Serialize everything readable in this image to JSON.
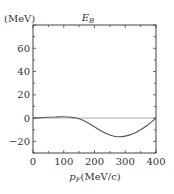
{
  "chart_data": {
    "type": "line",
    "title_main": "E",
    "title_sub": "B",
    "ylabel": "(MeV)",
    "xlabel": "p_F(MeV/c)",
    "xlabel_main": "p",
    "xlabel_sub": "F",
    "xlabel_unit": "(MeV/c)",
    "xlim": [
      0,
      400
    ],
    "ylim": [
      -30,
      80
    ],
    "xticks": [
      0,
      100,
      200,
      300,
      400
    ],
    "yticks": [
      -20,
      0,
      20,
      40,
      60
    ],
    "xtick_labels": [
      "0",
      "100",
      "200",
      "300",
      "400"
    ],
    "ytick_labels": [
      "−20",
      "0",
      "20",
      "40",
      "60"
    ],
    "grid": false,
    "reference_line_y": 0,
    "series": [
      {
        "name": "E_B",
        "x": [
          0,
          25,
          50,
          75,
          100,
          125,
          150,
          175,
          200,
          225,
          250,
          275,
          300,
          325,
          350,
          375,
          400
        ],
        "values": [
          0,
          0.3,
          0.7,
          1.0,
          1.1,
          0.7,
          -0.5,
          -3.5,
          -7.5,
          -11.5,
          -14.5,
          -16,
          -15.5,
          -13.5,
          -10,
          -5.5,
          0
        ]
      }
    ]
  }
}
